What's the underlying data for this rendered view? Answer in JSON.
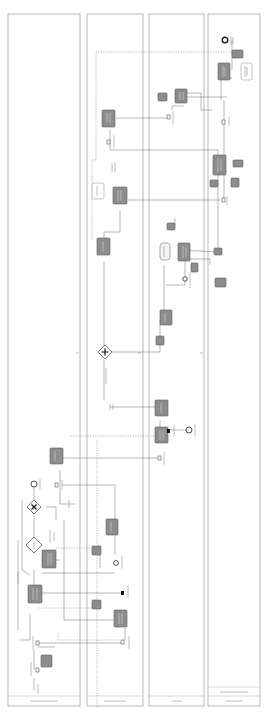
{
  "diagram": {
    "type": "bpmn-collaboration",
    "orientation": "rotated-90",
    "colors": {
      "task_fill": "#8d8d8d",
      "pool_stroke": "#9a9a9a",
      "flow_stroke": "#6e6e6e",
      "background": "#ffffff"
    },
    "pools": [
      {
        "id": "pool-1",
        "label": ""
      },
      {
        "id": "pool-2",
        "label": ""
      },
      {
        "id": "pool-3",
        "label": ""
      },
      {
        "id": "pool-4",
        "label": "",
        "sublabel": ""
      }
    ],
    "gateways": [
      {
        "id": "gw-exclusive",
        "kind": "exclusive",
        "icon": "x-mark"
      },
      {
        "id": "gw-decision",
        "kind": "exclusive-empty"
      },
      {
        "id": "gw-parallel",
        "kind": "parallel",
        "icon": "plus"
      }
    ],
    "events": [
      {
        "id": "start-pool1",
        "kind": "start"
      },
      {
        "id": "end-pool2",
        "kind": "end"
      },
      {
        "id": "end-pool3",
        "kind": "end"
      },
      {
        "id": "end-pool4",
        "kind": "end"
      }
    ],
    "task_count": 16,
    "data_store_count": 4
  }
}
